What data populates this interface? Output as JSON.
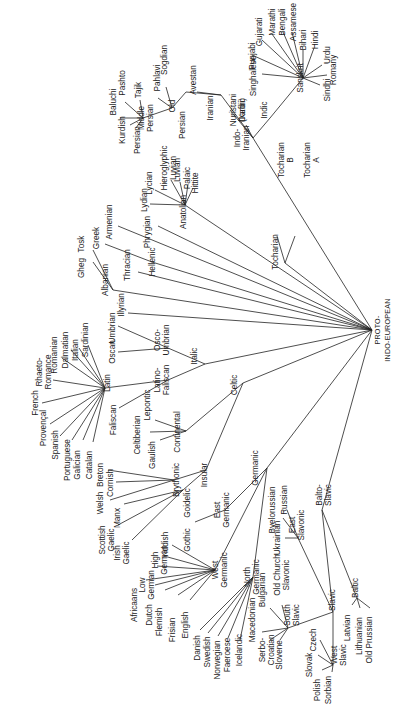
{
  "diagram": {
    "orientation": "rotated 90° (text reads bottom-to-top)",
    "root": {
      "id": "pie",
      "label": "PROTO-",
      "label2": "INDO-EUROPEAN",
      "x": 340,
      "y": 330
    },
    "nodes": [
      {
        "id": "tocharian",
        "label": "Tocharian",
        "x": 278,
        "y": 252
      },
      {
        "id": "tochB",
        "label": "Tocharian",
        "label2": "B",
        "x": 284,
        "y": 160
      },
      {
        "id": "tochA",
        "label": "Tocharian",
        "label2": "A",
        "x": 310,
        "y": 160
      },
      {
        "id": "indoiranian",
        "label": "Indo-",
        "label2": "Iranian",
        "x": 240,
        "y": 138
      },
      {
        "id": "iranian",
        "label": "Iranian",
        "x": 213,
        "y": 108
      },
      {
        "id": "old",
        "label": "Old",
        "x": 175,
        "y": 106
      },
      {
        "id": "persianOld",
        "label": "Persian",
        "x": 185,
        "y": 125
      },
      {
        "id": "avestan",
        "label": "Avestan",
        "x": 196,
        "y": 80
      },
      {
        "id": "pahlavi",
        "label": "Pahlavi",
        "x": 160,
        "y": 78
      },
      {
        "id": "sogdian",
        "label": "Sogdian",
        "x": 167,
        "y": 60
      },
      {
        "id": "middlePersian",
        "label": "Middle",
        "label2": "Persian",
        "x": 144,
        "y": 118
      },
      {
        "id": "baluchi",
        "label": "Baluchi",
        "x": 116,
        "y": 102
      },
      {
        "id": "pashto",
        "label": "Pashto",
        "x": 125,
        "y": 83
      },
      {
        "id": "tajik",
        "label": "Tajik",
        "x": 141,
        "y": 90
      },
      {
        "id": "kurdish",
        "label": "Kurdish",
        "x": 125,
        "y": 130
      },
      {
        "id": "persian",
        "label": "Persian",
        "x": 140,
        "y": 140
      },
      {
        "id": "nuristani",
        "label": "Nuristani",
        "label2": "(Kafiri)",
        "x": 236,
        "y": 110
      },
      {
        "id": "dardic",
        "label": "Dardic",
        "x": 245,
        "y": 110
      },
      {
        "id": "indic",
        "label": "Indic",
        "x": 267,
        "y": 110
      },
      {
        "id": "sanskrit",
        "label": "Sanskrit",
        "x": 303,
        "y": 78
      },
      {
        "id": "singhalese",
        "label": "Singhalese",
        "x": 256,
        "y": 76
      },
      {
        "id": "punjabi",
        "label": "Punjabi",
        "x": 255,
        "y": 56
      },
      {
        "id": "gujarati",
        "label": "Gujarati",
        "x": 262,
        "y": 32
      },
      {
        "id": "marathi",
        "label": "Marathi",
        "x": 275,
        "y": 22
      },
      {
        "id": "bengali",
        "label": "Bengali",
        "x": 285,
        "y": 22
      },
      {
        "id": "assamese",
        "label": "Assamese",
        "x": 296,
        "y": 22
      },
      {
        "id": "bihari",
        "label": "Bihari",
        "x": 306,
        "y": 40
      },
      {
        "id": "hindi",
        "label": "Hindi",
        "x": 318,
        "y": 40
      },
      {
        "id": "urdu",
        "label": "Urdu",
        "x": 330,
        "y": 55
      },
      {
        "id": "romany",
        "label": "Romany",
        "x": 336,
        "y": 70
      },
      {
        "id": "sindhi",
        "label": "Sindhi",
        "x": 330,
        "y": 90
      },
      {
        "id": "anatolian",
        "label": "Anatolian",
        "x": 186,
        "y": 212
      },
      {
        "id": "hittite",
        "label": "Hittite",
        "x": 198,
        "y": 183
      },
      {
        "id": "palaic",
        "label": "Palaic",
        "x": 190,
        "y": 178
      },
      {
        "id": "luvian",
        "label": "Luvian",
        "x": 180,
        "y": 170
      },
      {
        "id": "hierLuvian",
        "label": "Hieroglyphic",
        "label2": "Luvian",
        "x": 167,
        "y": 168
      },
      {
        "id": "lycian",
        "label": "Lycian",
        "x": 152,
        "y": 183
      },
      {
        "id": "lydian",
        "label": "Lydian",
        "x": 147,
        "y": 200
      },
      {
        "id": "phrygian",
        "label": "Phrygian",
        "x": 150,
        "y": 232
      },
      {
        "id": "armenian",
        "label": "Armenian",
        "x": 112,
        "y": 222
      },
      {
        "id": "greek",
        "label": "Greek",
        "x": 99,
        "y": 238
      },
      {
        "id": "hellenic",
        "label": "Hellenic",
        "x": 155,
        "y": 262
      },
      {
        "id": "thracian",
        "label": "Thracian",
        "x": 130,
        "y": 265
      },
      {
        "id": "albanian",
        "label": "Albanian",
        "x": 108,
        "y": 280
      },
      {
        "id": "gheg",
        "label": "Gheg",
        "x": 84,
        "y": 268
      },
      {
        "id": "tosk",
        "label": "Tosk",
        "x": 84,
        "y": 244
      },
      {
        "id": "illyrian",
        "label": "Illyrian",
        "x": 124,
        "y": 305
      },
      {
        "id": "italic",
        "label": "Italic",
        "x": 197,
        "y": 356
      },
      {
        "id": "oscoUmbrian",
        "label": "Osco-",
        "label2": "Umbrian",
        "x": 160,
        "y": 340
      },
      {
        "id": "umbrian",
        "label": "Umbrian",
        "x": 115,
        "y": 328
      },
      {
        "id": "oscan",
        "label": "Oscan",
        "x": 115,
        "y": 352
      },
      {
        "id": "latinoFaliscan",
        "label": "Latino-",
        "label2": "Faliscan",
        "x": 160,
        "y": 380
      },
      {
        "id": "latin",
        "label": "Latin",
        "x": 110,
        "y": 383
      },
      {
        "id": "faliscan",
        "label": "Faliscan",
        "x": 116,
        "y": 420
      },
      {
        "id": "sardinian",
        "label": "Sardinian",
        "x": 88,
        "y": 340
      },
      {
        "id": "italian",
        "label": "Italian",
        "x": 78,
        "y": 350
      },
      {
        "id": "dalmatian",
        "label": "Dalmatian",
        "x": 68,
        "y": 350
      },
      {
        "id": "romanian",
        "label": "Romanian",
        "x": 57,
        "y": 355
      },
      {
        "id": "rhaetoRomance",
        "label": "Rhaeto-",
        "label2": "Romance",
        "x": 42,
        "y": 372
      },
      {
        "id": "french",
        "label": "French",
        "x": 38,
        "y": 403
      },
      {
        "id": "provencal",
        "label": "Provençal",
        "x": 46,
        "y": 428
      },
      {
        "id": "spanish",
        "label": "Spanish",
        "x": 58,
        "y": 445
      },
      {
        "id": "portuguese",
        "label": "Portuguese",
        "x": 70,
        "y": 460
      },
      {
        "id": "galician",
        "label": "Galician",
        "x": 80,
        "y": 465
      },
      {
        "id": "catalan",
        "label": "Catalan",
        "x": 92,
        "y": 465
      },
      {
        "id": "celtic",
        "label": "Celtic",
        "x": 237,
        "y": 385
      },
      {
        "id": "continental",
        "label": "Continental",
        "x": 180,
        "y": 432
      },
      {
        "id": "lepontic",
        "label": "Lepontic",
        "x": 150,
        "y": 405
      },
      {
        "id": "celtiberian",
        "label": "Celtiberian",
        "x": 140,
        "y": 435
      },
      {
        "id": "gaulish",
        "label": "Gaulish",
        "x": 155,
        "y": 455
      },
      {
        "id": "insular",
        "label": "Insular",
        "x": 207,
        "y": 475
      },
      {
        "id": "brythonic",
        "label": "Brythonic",
        "x": 179,
        "y": 480
      },
      {
        "id": "goidelic",
        "label": "Goidelic",
        "x": 190,
        "y": 503
      },
      {
        "id": "breton",
        "label": "Breton",
        "x": 103,
        "y": 475
      },
      {
        "id": "cornish",
        "label": "Cornish",
        "x": 113,
        "y": 483
      },
      {
        "id": "welsh",
        "label": "Welsh",
        "x": 103,
        "y": 503
      },
      {
        "id": "manx",
        "label": "Manx",
        "x": 120,
        "y": 518
      },
      {
        "id": "scottishGaelic",
        "label": "Scottish",
        "label2": "Gaelic",
        "x": 105,
        "y": 540
      },
      {
        "id": "irishGaelic",
        "label": "Irish",
        "label2": "Gaelic",
        "x": 120,
        "y": 553
      },
      {
        "id": "germanic",
        "label": "Germanic",
        "x": 258,
        "y": 468
      },
      {
        "id": "eastGermanic",
        "label": "East",
        "label2": "Germanic",
        "x": 220,
        "y": 510
      },
      {
        "id": "gothic",
        "label": "Gothic",
        "x": 190,
        "y": 540
      },
      {
        "id": "westGermanic",
        "label": "West",
        "label2": "Germanic",
        "x": 218,
        "y": 570
      },
      {
        "id": "northGermanic",
        "label": "North",
        "label2": "Germanic",
        "x": 250,
        "y": 577
      },
      {
        "id": "yiddish",
        "label": "Yiddish",
        "x": 168,
        "y": 545
      },
      {
        "id": "highGerman",
        "label": "High",
        "label2": "German",
        "x": 158,
        "y": 560
      },
      {
        "id": "lowGerman",
        "label": "Low",
        "label2": "German",
        "x": 145,
        "y": 585
      },
      {
        "id": "africaans",
        "label": "Africaans",
        "x": 137,
        "y": 605
      },
      {
        "id": "dutch",
        "label": "Dutch",
        "x": 152,
        "y": 615
      },
      {
        "id": "flemish",
        "label": "Flemish",
        "x": 162,
        "y": 622
      },
      {
        "id": "frisian",
        "label": "Frisian",
        "x": 175,
        "y": 630
      },
      {
        "id": "english",
        "label": "English",
        "x": 188,
        "y": 625
      },
      {
        "id": "danish",
        "label": "Danish",
        "x": 200,
        "y": 648
      },
      {
        "id": "swedish",
        "label": "Swedish",
        "x": 210,
        "y": 652
      },
      {
        "id": "norwegian",
        "label": "Norwegian",
        "x": 220,
        "y": 660
      },
      {
        "id": "faeroese",
        "label": "Faeroese",
        "x": 230,
        "y": 655
      },
      {
        "id": "icelandic",
        "label": "Icelandic",
        "x": 242,
        "y": 650
      },
      {
        "id": "baltoSlavic",
        "label": "Balto-",
        "label2": "Slavic",
        "x": 322,
        "y": 495
      },
      {
        "id": "slavic",
        "label": "Slavic",
        "x": 335,
        "y": 600
      },
      {
        "id": "baltic",
        "label": "Baltic",
        "x": 358,
        "y": 588
      },
      {
        "id": "latvian",
        "label": "Latvian",
        "x": 350,
        "y": 628
      },
      {
        "id": "lithuanian",
        "label": "Lithuanian",
        "x": 362,
        "y": 636
      },
      {
        "id": "oldPrussian",
        "label": "Old Prussian",
        "x": 372,
        "y": 640
      },
      {
        "id": "eastSlavonic",
        "label": "East",
        "label2": "Slavonic",
        "x": 295,
        "y": 525
      },
      {
        "id": "russian",
        "label": "Russian",
        "x": 287,
        "y": 500
      },
      {
        "id": "byelorussian",
        "label": "Byelorussian",
        "x": 275,
        "y": 510
      },
      {
        "id": "ukrainian",
        "label": "Ukrainian",
        "x": 280,
        "y": 538
      },
      {
        "id": "southSlavic",
        "label": "South",
        "label2": "Slavic",
        "x": 290,
        "y": 615
      },
      {
        "id": "oldChurchSlavonic",
        "label": "Old Church",
        "label2": "Slavonic",
        "x": 280,
        "y": 575
      },
      {
        "id": "bulgarian",
        "label": "Bulgarian",
        "x": 265,
        "y": 590
      },
      {
        "id": "macedonian",
        "label": "Macedonian",
        "x": 255,
        "y": 620
      },
      {
        "id": "serboCroatian",
        "label": "Serbo-",
        "label2": "Croatian",
        "x": 265,
        "y": 650
      },
      {
        "id": "slovene",
        "label": "Slovene",
        "x": 282,
        "y": 655
      },
      {
        "id": "westSlavic",
        "label": "West",
        "label2": "Slavic",
        "x": 337,
        "y": 655
      },
      {
        "id": "czech",
        "label": "Czech",
        "x": 316,
        "y": 640
      },
      {
        "id": "slovak",
        "label": "Slovak",
        "x": 312,
        "y": 665
      },
      {
        "id": "polish",
        "label": "Polish",
        "x": 320,
        "y": 690
      },
      {
        "id": "sorbian",
        "label": "Sorbian",
        "x": 331,
        "y": 690
      }
    ]
  }
}
